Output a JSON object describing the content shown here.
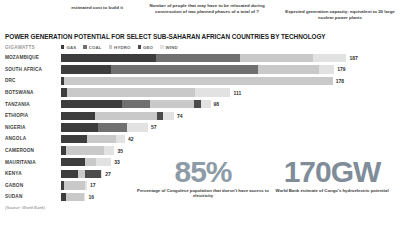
{
  "annotations": {
    "caption_1": "estimated cost to build it",
    "caption_2": "Number of people that may have to be relocated during construction of two planned phases of a total of ?",
    "caption_3": "Expected generation capacity; equivalent to 20 large nuclear power plants"
  },
  "chart": {
    "title": "POWER GENERATION POTENTIAL FOR SELECT SUB-SAHARAN AFRICAN COUNTRIES BY TECHNOLOGY",
    "unit_label": "GIGAWATTS",
    "source": "(Source: World Bank)"
  },
  "stats": [
    {
      "value": "85%",
      "caption": "Percentage of Congolese population that doesn't have access to electricity"
    },
    {
      "value": "170GW",
      "caption": "World Bank estimate of Congo's hydroelectric potential"
    }
  ],
  "chart_data": {
    "type": "bar",
    "subtype": "stacked-horizontal",
    "title": "POWER GENERATION POTENTIAL FOR SELECT SUB-SAHARAN AFRICAN COUNTRIES BY TECHNOLOGY",
    "xlabel": "GIGAWATTS",
    "ylabel": "",
    "grid": false,
    "legend_position": "top",
    "xlim": [
      0,
      190
    ],
    "categories": [
      "MOZAMBIQUE",
      "SOUTH AFRICA",
      "DRC",
      "BOTSWANA",
      "TANZANIA",
      "ETHIOPIA",
      "NIGERIA",
      "ANGOLA",
      "CAMEROON",
      "MAURITANIA",
      "KENYA",
      "GABON",
      "SUDAN"
    ],
    "totals": [
      187,
      179,
      178,
      111,
      98,
      74,
      57,
      42,
      35,
      33,
      27,
      17,
      16
    ],
    "series": [
      {
        "name": "GAS",
        "color": "#3d3d3d",
        "values": [
          62,
          33,
          2,
          4,
          40,
          22,
          24,
          17,
          3,
          16,
          11,
          2,
          3
        ]
      },
      {
        "name": "COAL",
        "color": "#707070",
        "values": [
          55,
          96,
          0,
          0,
          18,
          0,
          19,
          0,
          0,
          0,
          0,
          0,
          0
        ]
      },
      {
        "name": "HYDRO",
        "color": "#c9c9c9",
        "values": [
          48,
          40,
          176,
          84,
          29,
          41,
          0,
          19,
          25,
          7,
          5,
          14,
          12
        ]
      },
      {
        "name": "GEO",
        "color": "#4b4b4b",
        "values": [
          0,
          0,
          0,
          0,
          5,
          4,
          0,
          0,
          0,
          0,
          10,
          0,
          0
        ]
      },
      {
        "name": "WIND",
        "color": "#e2e2e2",
        "values": [
          22,
          10,
          0,
          23,
          6,
          7,
          14,
          6,
          7,
          10,
          1,
          1,
          1
        ]
      }
    ]
  }
}
